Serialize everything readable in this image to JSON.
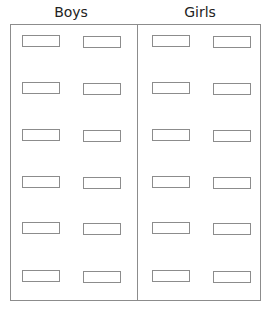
{
  "headings": {
    "left": "Boys",
    "right": "Girls"
  },
  "layout": {
    "rows": 6,
    "columns_per_group": 2,
    "row_tops": [
      35,
      82,
      129,
      176,
      222,
      270
    ],
    "column_lefts": [
      22,
      83,
      152,
      213
    ]
  },
  "colors": {
    "line": "#8c8c8c",
    "text": "#222222",
    "background": "#ffffff"
  }
}
